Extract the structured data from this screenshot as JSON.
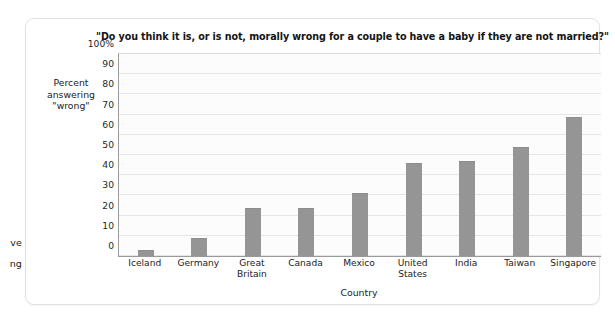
{
  "edge_fragments": [
    "ve",
    "ng"
  ],
  "chart_data": {
    "type": "bar",
    "title": "\"Do you think it is, or is not, morally wrong for a couple to have a baby if they are not married?\"",
    "xlabel": "Country",
    "ylabel": "Percent answering \"wrong\"",
    "ylabel_lines": [
      "Percent",
      "answering",
      "\"wrong\""
    ],
    "categories": [
      "Iceland",
      "Germany",
      "Great\nBritain",
      "Canada",
      "Mexico",
      "United\nStates",
      "India",
      "Taiwan",
      "Singapore"
    ],
    "values": [
      3,
      9,
      24,
      24,
      31,
      46,
      47,
      54,
      69
    ],
    "ylim": [
      0,
      100
    ],
    "yticks": [
      0,
      10,
      20,
      30,
      40,
      50,
      60,
      70,
      80,
      90,
      100
    ],
    "ytick_labels": [
      "0",
      "10",
      "20",
      "30",
      "40",
      "50",
      "60",
      "70",
      "80",
      "90",
      "100%"
    ],
    "grid": true,
    "legend": "none",
    "bar_color": "#959595",
    "plot_background": "#fcfcfc",
    "gridline_color": "#e6e6e6"
  }
}
